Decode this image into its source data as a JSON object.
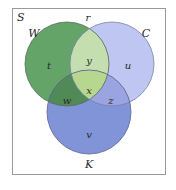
{
  "diagram": {
    "type": "venn-3",
    "universe_label": "S",
    "outside_region_label": "r",
    "sets": [
      {
        "id": "W",
        "label": "W",
        "color": "#5f9e62"
      },
      {
        "id": "C",
        "label": "C",
        "color": "#b7bff0"
      },
      {
        "id": "K",
        "label": "K",
        "color": "#7f8fd6"
      }
    ],
    "regions": {
      "W_only": "t",
      "W_and_C_only": "y",
      "C_only": "u",
      "W_C_K": "x",
      "W_and_K_only": "w",
      "C_and_K_only": "z",
      "K_only": "v"
    },
    "colors": {
      "W_only": "#65a468",
      "C_only": "#bfc6f2",
      "K_only": "#8294d8",
      "W_and_C": "#c4deb0",
      "W_and_K": "#4f8a57",
      "C_and_K": "#9aa4e0",
      "W_C_K": "#b8d78e",
      "frame": "#9a9a9a",
      "outline": "#6a6a6a"
    }
  }
}
